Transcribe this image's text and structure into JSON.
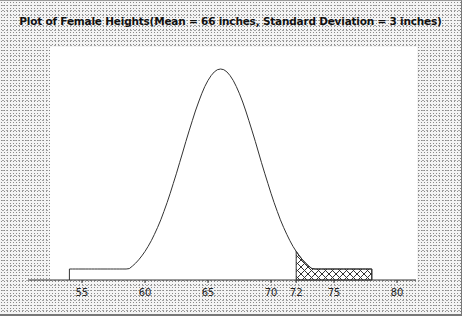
{
  "chart_data": {
    "type": "line",
    "title": "Plot of Female Heights(Mean = 66 inches, Standard Deviation = 3 inches)",
    "xlabel": "",
    "ylabel": "",
    "distribution": "normal",
    "mean": 66,
    "std_dev": 3,
    "x_range": [
      54,
      78
    ],
    "xlim": [
      52,
      82
    ],
    "x_ticks": [
      55,
      60,
      65,
      70,
      72,
      75,
      80
    ],
    "x_tick_labels": [
      "55",
      "60",
      "65",
      "70",
      "72",
      "75",
      "80"
    ],
    "grid": false,
    "legend": null,
    "shaded_region": {
      "from": 72,
      "to": 78,
      "pattern": "crosshatch",
      "meaning": "heights above 72 inches"
    },
    "series": [
      {
        "name": "Normal density (mean 66, sd 3)",
        "x": [
          54,
          55,
          56,
          57,
          58,
          59,
          60,
          61,
          62,
          63,
          64,
          65,
          66,
          67,
          68,
          69,
          70,
          71,
          72,
          73,
          74,
          75,
          76,
          77,
          78
        ],
        "values": [
          0.0001,
          0.0015,
          0.001,
          0.0038,
          0.0038,
          0.0087,
          0.018,
          0.0332,
          0.0547,
          0.0807,
          0.1065,
          0.1258,
          0.133,
          0.1258,
          0.1065,
          0.0807,
          0.0547,
          0.0332,
          0.018,
          0.0087,
          0.0038,
          0.0015,
          0.0005,
          0.0001,
          0.0
        ]
      }
    ]
  },
  "colors": {
    "curve": "#333333",
    "axis": "#333333",
    "hatch": "#333333",
    "plot_background": "#ffffff",
    "frame_background": "#dcdcdc"
  }
}
